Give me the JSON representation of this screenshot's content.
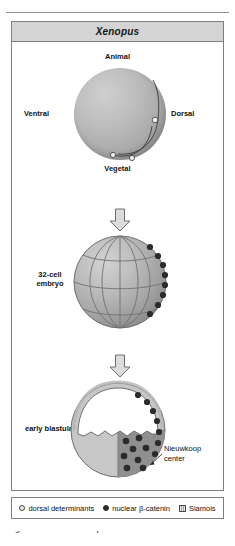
{
  "figure": {
    "title": "Xenopus",
    "panels": [
      {
        "id": "oocyte",
        "labels": {
          "animal": "Animal",
          "vegetal": "Vegetal",
          "ventral": "Ventral",
          "dorsal": "Dorsal"
        },
        "markers": {
          "dorsal_determinants_count": 3,
          "track_description": "curved microtubule track toward dorsal side"
        }
      },
      {
        "id": "32-cell-embryo",
        "stage_label": "32-cell embryo",
        "markers": {
          "nuclear_beta_catenin_count": 8
        }
      },
      {
        "id": "early-blastula",
        "stage_label": "early blastula",
        "annotation": "Nieuwkoop center",
        "markers": {
          "nuclear_beta_catenin_rim_count": 7,
          "nuclear_beta_catenin_center_count": 8,
          "siamois_region": "Nieuwkoop center"
        }
      }
    ],
    "arrows": [
      {
        "name": "arrow-oocyte-to-32cell",
        "direction": "down"
      },
      {
        "name": "arrow-32cell-to-blastula",
        "direction": "down"
      }
    ],
    "legend": [
      {
        "marker": "open-circle",
        "label": "dorsal determinants"
      },
      {
        "marker": "filled-circle",
        "label": "nuclear β-catenin"
      },
      {
        "marker": "shaded-square",
        "label": "Siamois"
      }
    ]
  },
  "caption": {
    "text": "Figure 1 The Dorsal displacement of dorsal determinants"
  },
  "colors": {
    "title_bar": "#d4d4d4",
    "frame_border": "#7a7f85",
    "cell_light": "#c6c6c6",
    "cell_mid": "#a8a8a8",
    "cell_dark": "#8a8a8a",
    "marker_filled": "#2b2b2b",
    "marker_open": "#e9e9e9",
    "nieuwkoop": "#8f8f8f"
  }
}
